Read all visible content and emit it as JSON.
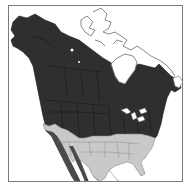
{
  "map": {
    "title": "North America range map",
    "region": "North America",
    "colors": {
      "background": "#ffffff",
      "frame": "#7a7a7a",
      "breeding_range": "#2f2f2f",
      "year_round_range": "#c9c9c9",
      "mountain_band": "#5a5a5a",
      "borders": "#8a8a8a",
      "unoccupied": "#ffffff"
    },
    "legend": [],
    "labels": []
  }
}
